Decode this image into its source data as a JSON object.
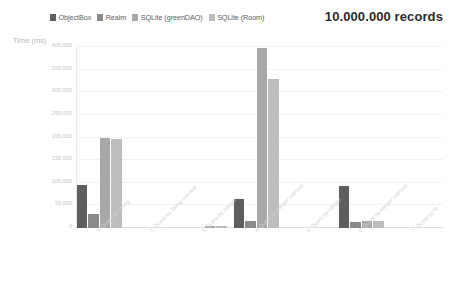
{
  "title": "10.000.000 records",
  "legend": {
    "position": "top-left",
    "items": [
      {
        "label": "ObjectBox",
        "color": "#5e5e5e"
      },
      {
        "label": "Realm",
        "color": "#8a8a8a"
      },
      {
        "label": "SQLite (greenDAO)",
        "color": "#a8a8a8"
      },
      {
        "label": "SQLite (Room)",
        "color": "#bdbdbd"
      }
    ]
  },
  "chart_data": {
    "type": "bar",
    "title": "10.000.000 records",
    "xlabel": "",
    "ylabel": "Time (ms)",
    "ylim": [
      0,
      400000
    ],
    "grid": true,
    "legend_position": "top-left",
    "ytick_labels": [
      "0",
      "50,000",
      "100,000",
      "150,000",
      "200,000",
      "250,000",
      "300,000",
      "350,000",
      "400,000"
    ],
    "ytick_values": [
      0,
      50000,
      100000,
      150000,
      200000,
      250000,
      300000,
      350000,
      400000
    ],
    "categories": [
      "1. Query by String",
      "2. Query by String indexed",
      "3. Query by Integer",
      "4. Query by Integer indexed",
      "5. Query by Integer",
      "6. Query by Integer indexed",
      "7. Query by Id"
    ],
    "series": [
      {
        "name": "ObjectBox",
        "color": "#5e5e5e",
        "values": [
          95000,
          0,
          0,
          65000,
          0,
          92000,
          0
        ]
      },
      {
        "name": "Realm",
        "color": "#8a8a8a",
        "values": [
          30000,
          0,
          0,
          16000,
          0,
          14000,
          0
        ]
      },
      {
        "name": "SQLite (greenDAO)",
        "color": "#a8a8a8",
        "values": [
          198000,
          0,
          3500,
          398000,
          0,
          16000,
          0
        ]
      },
      {
        "name": "SQLite (Room)",
        "color": "#bdbdbd",
        "values": [
          196000,
          0,
          3500,
          330000,
          0,
          16000,
          0
        ]
      }
    ]
  }
}
